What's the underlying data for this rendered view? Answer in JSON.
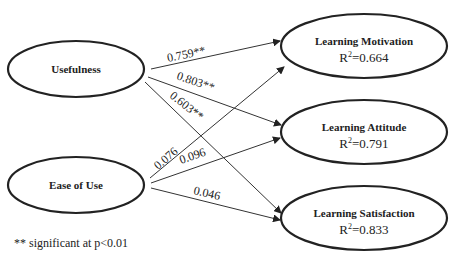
{
  "diagram": {
    "type": "path-model",
    "nodes": {
      "usefulness": {
        "label": "Usefulness"
      },
      "ease_of_use": {
        "label": "Ease of Use"
      },
      "motivation": {
        "label": "Learning Motivation",
        "r2_prefix": "R",
        "r2_sup": "2",
        "r2_value": "=0.664"
      },
      "attitude": {
        "label": "Learning Attitude",
        "r2_prefix": "R",
        "r2_sup": "2",
        "r2_value": "=0.791"
      },
      "satisfaction": {
        "label": "Learning Satisfaction",
        "r2_prefix": "R",
        "r2_sup": "2",
        "r2_value": "=0.833"
      }
    },
    "edges": [
      {
        "from": "Usefulness",
        "to": "Learning Motivation",
        "coef": "0.759**"
      },
      {
        "from": "Usefulness",
        "to": "Learning Attitude",
        "coef": "0.803**"
      },
      {
        "from": "Usefulness",
        "to": "Learning Satisfaction",
        "coef": "0.603**"
      },
      {
        "from": "Ease of Use",
        "to": "Learning Motivation",
        "coef": "0.076"
      },
      {
        "from": "Ease of Use",
        "to": "Learning Attitude",
        "coef": "0.096"
      },
      {
        "from": "Ease of Use",
        "to": "Learning Satisfaction",
        "coef": "0.046"
      }
    ],
    "note": "** significant at p<0.01"
  }
}
